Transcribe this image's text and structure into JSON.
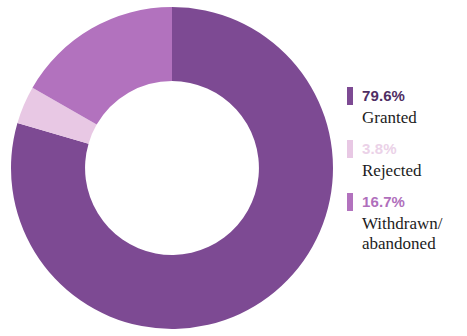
{
  "chart_data": {
    "type": "pie",
    "variant": "donut",
    "title": "",
    "subtitle": "",
    "xlabel": "",
    "ylabel": "",
    "grid": false,
    "legend_position": "right",
    "start_angle_deg": 0,
    "direction": "clockwise",
    "inner_radius_ratio": 0.54,
    "categories": [
      "Granted",
      "Rejected",
      "Withdrawn/\nabandoned"
    ],
    "values": [
      79.6,
      3.8,
      16.7
    ],
    "value_labels": [
      "79.6%",
      "3.8%",
      "16.7%"
    ],
    "colors": [
      "#7D4A93",
      "#E8C8E4",
      "#B272BE"
    ],
    "series": [
      {
        "name": "Outcome share",
        "values": [
          79.6,
          3.8,
          16.7
        ]
      }
    ],
    "slices": [
      {
        "label": "Granted",
        "value": 79.6,
        "value_label": "79.6%",
        "color": "#7D4A93",
        "start_deg": 0,
        "end_deg": 286.56
      },
      {
        "label": "Rejected",
        "value": 3.8,
        "value_label": "3.8%",
        "color": "#E8C8E4",
        "start_deg": 286.56,
        "end_deg": 300.24
      },
      {
        "label": "Withdrawn/\nabandoned",
        "value": 16.7,
        "value_label": "16.7%",
        "color": "#B272BE",
        "start_deg": 300.24,
        "end_deg": 360
      }
    ]
  },
  "legend": {
    "entries": [
      {
        "pct": "79.6%",
        "label": "Granted",
        "color": "#7D4A93",
        "pct_color": "#4F2E63"
      },
      {
        "pct": "3.8%",
        "label": "Rejected",
        "color": "#E8C8E4",
        "pct_color": "#EBD2E8"
      },
      {
        "pct": "16.7%",
        "label": "Withdrawn/\nabandoned",
        "color": "#B272BE",
        "pct_color": "#B06FBC"
      }
    ]
  }
}
